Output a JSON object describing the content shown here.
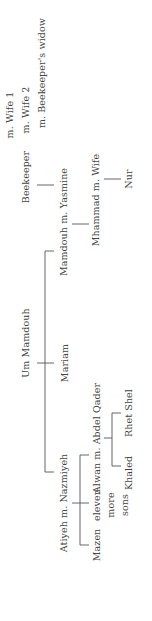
{
  "diagram": {
    "type": "family-tree",
    "orientation": "rotated-90-ccw",
    "root": {
      "name": "Um Mamdouh",
      "children": [
        {
          "name": "Mamdouh",
          "spouse": "Yasmine",
          "label": "Mamdouh m. Yasmine",
          "children": [
            {
              "name": "Mhammad",
              "spouse": "Wife",
              "label": "Mhammad m. Wife",
              "children": [
                {
                  "name": "Nur"
                }
              ]
            }
          ]
        },
        {
          "name": "Mariam"
        },
        {
          "name": "Atiyeh",
          "spouse": "Nazmiyeh",
          "label": "Atiyeh m. Nazmiyeh",
          "children": [
            {
              "name": "Alwan",
              "spouse": "Abdel Qader",
              "label": "Alwan m. Abdel Qader",
              "children": [
                {
                  "name": "Khaled"
                },
                {
                  "name": "Rhet Shel"
                }
              ]
            },
            {
              "name": "Mazen"
            },
            {
              "name": "eleven more sons",
              "lines": [
                "eleven",
                "more",
                "sons"
              ]
            }
          ]
        }
      ]
    },
    "beekeeper": {
      "name": "Beekeeper",
      "marriages": [
        "m. Wife 1",
        "m. Wife 2",
        "m. Beekeeper's widow"
      ]
    }
  },
  "labels": {
    "wife1": "m. Wife 1",
    "wife2": "m. Wife 2",
    "beekeepers_widow": "m. Beekeeper's widow",
    "beekeeper": "Beekeeper",
    "mamdouh": "Mamdouh m. Yasmine",
    "mhammad": "Mhammad m. Wife",
    "nur": "Nur",
    "um_mamdouh": "Um Mamdouh",
    "mariam": "Mariam",
    "atiyeh": "Atiyeh m. Nazmiyeh",
    "alwan": "Alwan m. Abdel Qader",
    "khaled": "Khaled",
    "rhet_shel": "Rhet Shel",
    "mazen": "Mazen",
    "eleven_more_sons": "eleven more sons"
  }
}
